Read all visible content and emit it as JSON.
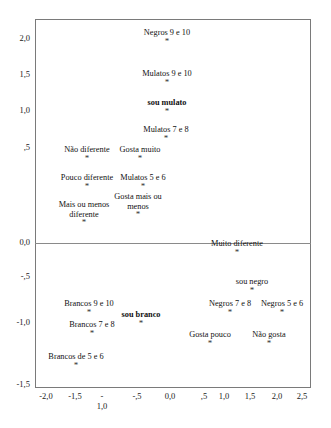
{
  "chart_data": {
    "type": "scatter",
    "title": "",
    "subtitle": "",
    "xlabel": "",
    "ylabel": "",
    "xlim": [
      -2.25,
      2.75
    ],
    "ylim": [
      -1.6,
      2.2
    ],
    "grid": false,
    "legend": null,
    "decimal_separator": ",",
    "marker_glyph": "*",
    "xticks": [
      "-2,0",
      "-1,5",
      "-\n1,0",
      "-,5",
      "0,0",
      ",5",
      "1,0",
      "1,5",
      "2,0",
      "2,5"
    ],
    "xtick_values": [
      -2.0,
      -1.5,
      -1.0,
      -0.5,
      0.0,
      0.5,
      1.0,
      1.5,
      2.0,
      2.5
    ],
    "yticks": [
      "2,0",
      "1,5",
      "1,0",
      ",5",
      "0,0",
      "-,5",
      "-1,0",
      "-1,5"
    ],
    "ytick_values": [
      2.0,
      1.5,
      1.0,
      0.5,
      0.0,
      -0.5,
      -1.0,
      -1.5
    ],
    "points": [
      {
        "label": "Negros 9 e 10",
        "x": 0.13,
        "y": 1.8,
        "bold": false
      },
      {
        "label": "Mulatos 9 e 10",
        "x": 0.13,
        "y": 1.25,
        "bold": false
      },
      {
        "label": "sou mulato",
        "x": 0.13,
        "y": 0.82,
        "bold": true
      },
      {
        "label": "Mulatos 7 e 8",
        "x": 0.13,
        "y": 0.58,
        "bold": false
      },
      {
        "label": "Não diferente",
        "x": -1.48,
        "y": 0.4,
        "bold": false
      },
      {
        "label": "Gosta muito",
        "x": -0.95,
        "y": 0.4,
        "bold": false
      },
      {
        "label": "Pouco diferente",
        "x": -1.48,
        "y": 0.22,
        "bold": false
      },
      {
        "label": "Mulatos 5 e 6",
        "x": -0.86,
        "y": 0.24,
        "bold": false
      },
      {
        "label": "Gosta mais ou menos",
        "x": -0.92,
        "y": 0.1,
        "bold": false
      },
      {
        "label": "Mais ou menos diferente",
        "x": -1.5,
        "y": 0.03,
        "bold": false
      },
      {
        "label": "Muito diferente",
        "x": 1.18,
        "y": -0.2,
        "bold": false
      },
      {
        "label": "sou negro",
        "x": 1.75,
        "y": -0.62,
        "bold": false
      },
      {
        "label": "Negros 7 e 8",
        "x": 1.16,
        "y": -0.82,
        "bold": false
      },
      {
        "label": "Negros 5 e 6",
        "x": 2.18,
        "y": -0.88,
        "bold": false
      },
      {
        "label": "Brancos 9 e 10",
        "x": -1.42,
        "y": -0.82,
        "bold": false
      },
      {
        "label": "sou branco",
        "x": -0.58,
        "y": -0.98,
        "bold": true
      },
      {
        "label": "Gosta pouco",
        "x": 0.87,
        "y": -1.06,
        "bold": false
      },
      {
        "label": "Não gosta",
        "x": 1.87,
        "y": -1.06,
        "bold": false
      },
      {
        "label": "Brancos 7 e 8",
        "x": -1.32,
        "y": -1.1,
        "bold": false
      },
      {
        "label": "Brancos de 5 e 6",
        "x": -1.6,
        "y": -1.28,
        "bold": false
      }
    ]
  },
  "plot": {
    "marker": "*",
    "axis": {
      "y_labels": [
        {
          "text": "2,0",
          "top": 34
        },
        {
          "text": "1,5",
          "top": 70
        },
        {
          "text": "1,0",
          "top": 106
        },
        {
          "text": ",5",
          "top": 143
        },
        {
          "text": "0,0",
          "top": 238
        },
        {
          "text": "-,5",
          "top": 272
        },
        {
          "text": "-1,0",
          "top": 318
        },
        {
          "text": "-1,5",
          "top": 380
        }
      ],
      "x_labels": [
        {
          "text": "-2,0",
          "left": 33
        },
        {
          "text": "-1,5",
          "left": 62
        },
        {
          "text": "-\n1,0",
          "left": 89
        },
        {
          "text": "-,5",
          "left": 124
        },
        {
          "text": "0,0",
          "left": 157
        },
        {
          "text": ",5",
          "left": 191
        },
        {
          "text": "1,0",
          "left": 211
        },
        {
          "text": "1,5",
          "left": 237
        },
        {
          "text": "2,0",
          "left": 264
        },
        {
          "text": "2,5",
          "left": 289
        }
      ]
    },
    "items": [
      {
        "text": "Negros 9 e 10",
        "left": 128,
        "top": 28,
        "width": 78,
        "bold": false
      },
      {
        "text": "Mulatos 9 e 10",
        "left": 128,
        "top": 69,
        "width": 78,
        "bold": false
      },
      {
        "text": "sou mulato",
        "left": 140,
        "top": 98,
        "width": 54,
        "bold": true
      },
      {
        "text": "Mulatos 7 e 8",
        "left": 130,
        "top": 125,
        "width": 72,
        "bold": false
      },
      {
        "text": "Não diferente",
        "left": 60,
        "top": 145,
        "width": 54,
        "bold": false
      },
      {
        "text": "Gosta muito",
        "left": 116,
        "top": 145,
        "width": 48,
        "bold": false
      },
      {
        "text": "Pouco diferente",
        "left": 60,
        "top": 173,
        "width": 54,
        "bold": false
      },
      {
        "text": "Mulatos 5 e 6",
        "left": 111,
        "top": 173,
        "width": 64,
        "bold": false
      },
      {
        "text": "Gosta mais ou menos",
        "left": 111,
        "top": 192,
        "width": 54,
        "bold": false
      },
      {
        "text": "Mais ou menos diferente",
        "left": 58,
        "top": 200,
        "width": 52,
        "bold": false
      },
      {
        "text": "Muito diferente",
        "left": 208,
        "top": 239,
        "width": 58,
        "bold": false
      },
      {
        "text": "sou negro",
        "left": 228,
        "top": 277,
        "width": 48,
        "bold": false
      },
      {
        "text": "Negros 7 e 8",
        "left": 199,
        "top": 299,
        "width": 62,
        "bold": false
      },
      {
        "text": "Negros 5 e 6",
        "left": 259,
        "top": 299,
        "width": 46,
        "bold": false
      },
      {
        "text": "Brancos 9 e 10",
        "left": 58,
        "top": 299,
        "width": 62,
        "bold": false
      },
      {
        "text": "sou branco",
        "left": 118,
        "top": 310,
        "width": 46,
        "bold": true
      },
      {
        "text": "Gosta pouco",
        "left": 183,
        "top": 330,
        "width": 54,
        "bold": false
      },
      {
        "text": "Não gosta",
        "left": 245,
        "top": 330,
        "width": 48,
        "bold": false
      },
      {
        "text": "Brancos 7 e 8",
        "left": 62,
        "top": 320,
        "width": 60,
        "bold": false
      },
      {
        "text": "Brancos de 5 e 6",
        "left": 38,
        "top": 352,
        "width": 76,
        "bold": false
      }
    ]
  }
}
